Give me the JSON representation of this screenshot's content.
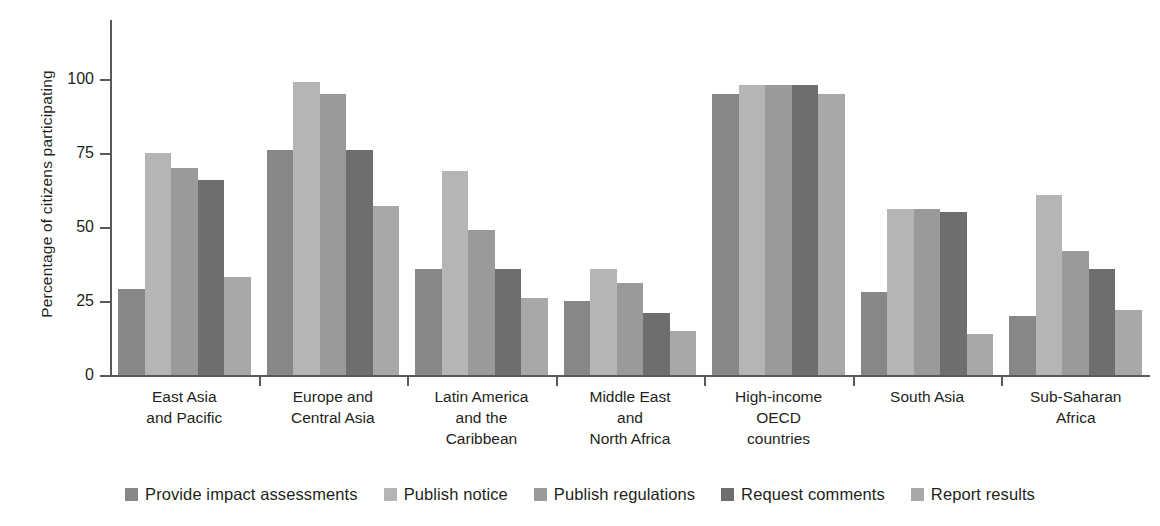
{
  "chart_data": {
    "type": "bar",
    "title": "",
    "xlabel": "",
    "ylabel": "Percentage of citizens participating",
    "ylim": [
      0,
      120
    ],
    "yticks": [
      0,
      25,
      50,
      75,
      100
    ],
    "ytick_labels": [
      "0",
      "25",
      "50",
      "75",
      "100"
    ],
    "grid": false,
    "legend_position": "bottom",
    "categories": [
      "East Asia\nand Pacific",
      "Europe and\nCentral Asia",
      "Latin America\nand the\nCaribbean",
      "Middle East\nand\nNorth Africa",
      "High-income\nOECD\ncountries",
      "South Asia",
      "Sub-Saharan\nAfrica"
    ],
    "category_lines": [
      [
        "East Asia",
        "and Pacific"
      ],
      [
        "Europe and",
        "Central Asia"
      ],
      [
        "Latin America",
        "and the",
        "Caribbean"
      ],
      [
        "Middle East",
        "and",
        "North Africa"
      ],
      [
        "High-income",
        "OECD",
        "countries"
      ],
      [
        "South Asia"
      ],
      [
        "Sub-Saharan",
        "Africa"
      ]
    ],
    "series": [
      {
        "name": "Provide impact assessments",
        "color": "#878787",
        "values": [
          29,
          76,
          36,
          25,
          95,
          28,
          20
        ]
      },
      {
        "name": "Publish notice",
        "color": "#b5b5b5",
        "values": [
          75,
          99,
          69,
          36,
          98,
          56,
          61
        ]
      },
      {
        "name": "Publish regulations",
        "color": "#9a9a9a",
        "values": [
          70,
          95,
          49,
          31,
          98,
          56,
          42
        ]
      },
      {
        "name": "Request comments",
        "color": "#6e6e6e",
        "values": [
          66,
          76,
          36,
          21,
          98,
          55,
          36
        ]
      },
      {
        "name": "Report results",
        "color": "#a8a8a8",
        "values": [
          33,
          57,
          26,
          15,
          95,
          14,
          22
        ]
      }
    ]
  },
  "colors": {
    "axis": "#58595b",
    "text": "#231f20",
    "background": "#ffffff"
  }
}
